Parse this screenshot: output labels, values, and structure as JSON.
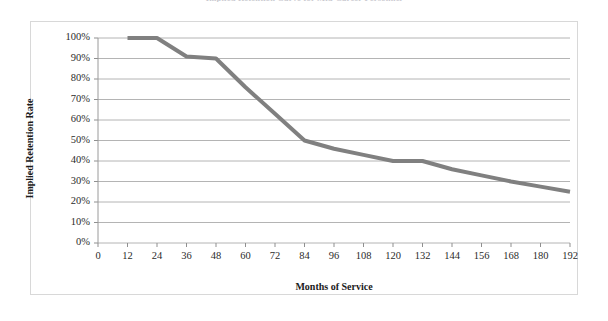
{
  "chart_data": {
    "type": "line",
    "title": "Implied Retention Curve for Mid-Career Personnel",
    "title_note": "title is cropped off the top edge of the screenshot",
    "xlabel": "Months of Service",
    "ylabel": "Implied Retention Rate",
    "xlim": [
      0,
      192
    ],
    "ylim": [
      0,
      1.0
    ],
    "grid": "horizontal",
    "legend": "none",
    "line_color": "#808080",
    "line_width_px": 4,
    "x_ticks": [
      0,
      12,
      24,
      36,
      48,
      60,
      72,
      84,
      96,
      108,
      120,
      132,
      144,
      156,
      168,
      180,
      192
    ],
    "x_tick_labels": [
      "0",
      "12",
      "24",
      "36",
      "48",
      "60",
      "72",
      "84",
      "96",
      "108",
      "120",
      "132",
      "144",
      "156",
      "168",
      "180",
      "192"
    ],
    "y_ticks": [
      0,
      0.1,
      0.2,
      0.3,
      0.4,
      0.5,
      0.6,
      0.7,
      0.8,
      0.9,
      1.0
    ],
    "y_tick_labels": [
      "0%",
      "10%",
      "20%",
      "30%",
      "40%",
      "50%",
      "60%",
      "70%",
      "80%",
      "90%",
      "100%"
    ],
    "series": [
      {
        "name": "Implied Retention Rate",
        "x": [
          12,
          24,
          36,
          48,
          60,
          72,
          84,
          96,
          108,
          120,
          132,
          144,
          156,
          168,
          180,
          192
        ],
        "values": [
          1.0,
          1.0,
          0.91,
          0.9,
          0.76,
          0.63,
          0.5,
          0.46,
          0.43,
          0.4,
          0.4,
          0.36,
          0.33,
          0.3,
          0.275,
          0.25
        ]
      }
    ]
  },
  "axes": {
    "y_title": "Implied Retention Rate",
    "x_title": "Months of Service"
  }
}
